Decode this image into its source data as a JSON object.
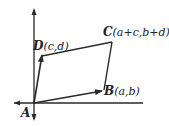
{
  "diagram": {
    "type": "parallelogram-vectors",
    "points": {
      "A": {
        "name": "A",
        "coords": ""
      },
      "B": {
        "name": "B",
        "coords": "(a,b)"
      },
      "C": {
        "name": "C",
        "coords": "(a+c,b+d)"
      },
      "D": {
        "name": "D",
        "coords": "(c,d)"
      }
    },
    "colors": {
      "stroke": "#2a2a2a",
      "background": "#ffffff"
    }
  }
}
